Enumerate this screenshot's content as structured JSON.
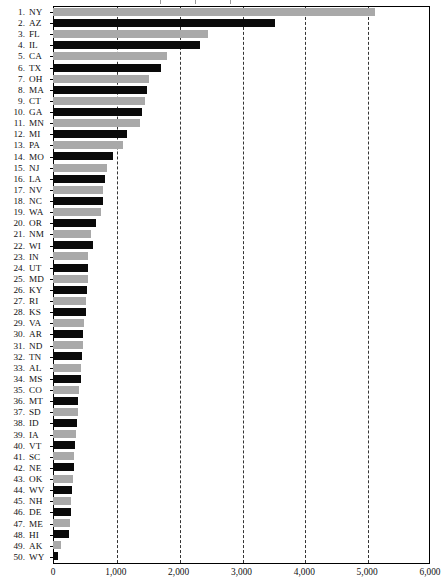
{
  "axis": {
    "x_ticks": [
      "0",
      "1,000",
      "2,000",
      "3,000",
      "4,000",
      "5,000",
      "6,000"
    ],
    "x_min": 0,
    "x_max": 6000
  },
  "chart_data": {
    "type": "bar",
    "orientation": "horizontal",
    "title": "",
    "subtitle": "",
    "xlabel": "",
    "ylabel": "",
    "xlim": [
      0,
      6000
    ],
    "grid": "vertical dashed gridlines at every 1,000",
    "legend": "none",
    "tick_labels_x": [
      "0",
      "1,000",
      "2,000",
      "3,000",
      "4,000",
      "5,000",
      "6,000"
    ],
    "note": "Ranked horizontal bar chart of 50 US states; bars alternate gray and black by rank parity",
    "categories": [
      "NY",
      "AZ",
      "FL",
      "IL",
      "CA",
      "TX",
      "OH",
      "MA",
      "CT",
      "GA",
      "MN",
      "MI",
      "PA",
      "MO",
      "NJ",
      "LA",
      "NV",
      "NC",
      "WA",
      "OR",
      "NM",
      "WI",
      "IN",
      "UT",
      "MD",
      "KY",
      "RI",
      "KS",
      "VA",
      "AR",
      "ND",
      "TN",
      "AL",
      "MS",
      "CO",
      "MT",
      "SD",
      "ID",
      "IA",
      "VT",
      "SC",
      "NE",
      "OK",
      "WV",
      "NH",
      "DE",
      "ME",
      "HI",
      "AK",
      "WY"
    ],
    "ranks": [
      1,
      2,
      3,
      4,
      5,
      6,
      7,
      8,
      9,
      10,
      11,
      12,
      13,
      14,
      15,
      16,
      17,
      18,
      19,
      20,
      21,
      22,
      23,
      24,
      25,
      26,
      27,
      28,
      29,
      30,
      31,
      32,
      33,
      34,
      35,
      36,
      37,
      38,
      39,
      40,
      41,
      42,
      43,
      44,
      45,
      46,
      47,
      48,
      49,
      50
    ],
    "values": [
      5130,
      3530,
      2470,
      2340,
      1820,
      1720,
      1520,
      1500,
      1470,
      1420,
      1390,
      1180,
      1120,
      960,
      860,
      830,
      800,
      790,
      770,
      690,
      600,
      630,
      560,
      560,
      550,
      540,
      530,
      520,
      500,
      480,
      470,
      460,
      450,
      440,
      420,
      400,
      390,
      380,
      370,
      350,
      340,
      330,
      320,
      310,
      290,
      280,
      270,
      260,
      130,
      80
    ],
    "colors": [
      "#a9a9a9",
      "#0a0a0a"
    ]
  },
  "labels": {
    "rows": [
      {
        "rank": "1.",
        "state": "NY"
      },
      {
        "rank": "2.",
        "state": "AZ"
      },
      {
        "rank": "3.",
        "state": "FL"
      },
      {
        "rank": "4.",
        "state": "IL"
      },
      {
        "rank": "5.",
        "state": "CA"
      },
      {
        "rank": "6.",
        "state": "TX"
      },
      {
        "rank": "7.",
        "state": "OH"
      },
      {
        "rank": "8.",
        "state": "MA"
      },
      {
        "rank": "9.",
        "state": "CT"
      },
      {
        "rank": "10.",
        "state": "GA"
      },
      {
        "rank": "11.",
        "state": "MN"
      },
      {
        "rank": "12.",
        "state": "MI"
      },
      {
        "rank": "13.",
        "state": "PA"
      },
      {
        "rank": "14.",
        "state": "MO"
      },
      {
        "rank": "15.",
        "state": "NJ"
      },
      {
        "rank": "16.",
        "state": "LA"
      },
      {
        "rank": "17.",
        "state": "NV"
      },
      {
        "rank": "18.",
        "state": "NC"
      },
      {
        "rank": "19.",
        "state": "WA"
      },
      {
        "rank": "20.",
        "state": "OR"
      },
      {
        "rank": "21.",
        "state": "NM"
      },
      {
        "rank": "22.",
        "state": "WI"
      },
      {
        "rank": "23.",
        "state": "IN"
      },
      {
        "rank": "24.",
        "state": "UT"
      },
      {
        "rank": "25.",
        "state": "MD"
      },
      {
        "rank": "26.",
        "state": "KY"
      },
      {
        "rank": "27.",
        "state": "RI"
      },
      {
        "rank": "28.",
        "state": "KS"
      },
      {
        "rank": "29.",
        "state": "VA"
      },
      {
        "rank": "30.",
        "state": "AR"
      },
      {
        "rank": "31.",
        "state": "ND"
      },
      {
        "rank": "32.",
        "state": "TN"
      },
      {
        "rank": "33.",
        "state": "AL"
      },
      {
        "rank": "34.",
        "state": "MS"
      },
      {
        "rank": "35.",
        "state": "CO"
      },
      {
        "rank": "36.",
        "state": "MT"
      },
      {
        "rank": "37.",
        "state": "SD"
      },
      {
        "rank": "38.",
        "state": "ID"
      },
      {
        "rank": "39.",
        "state": "IA"
      },
      {
        "rank": "40.",
        "state": "VT"
      },
      {
        "rank": "41.",
        "state": "SC"
      },
      {
        "rank": "42.",
        "state": "NE"
      },
      {
        "rank": "43.",
        "state": "OK"
      },
      {
        "rank": "44.",
        "state": "WV"
      },
      {
        "rank": "45.",
        "state": "NH"
      },
      {
        "rank": "46.",
        "state": "DE"
      },
      {
        "rank": "47.",
        "state": "ME"
      },
      {
        "rank": "48.",
        "state": "HI"
      },
      {
        "rank": "49.",
        "state": "AK"
      },
      {
        "rank": "50.",
        "state": "WY"
      }
    ]
  }
}
